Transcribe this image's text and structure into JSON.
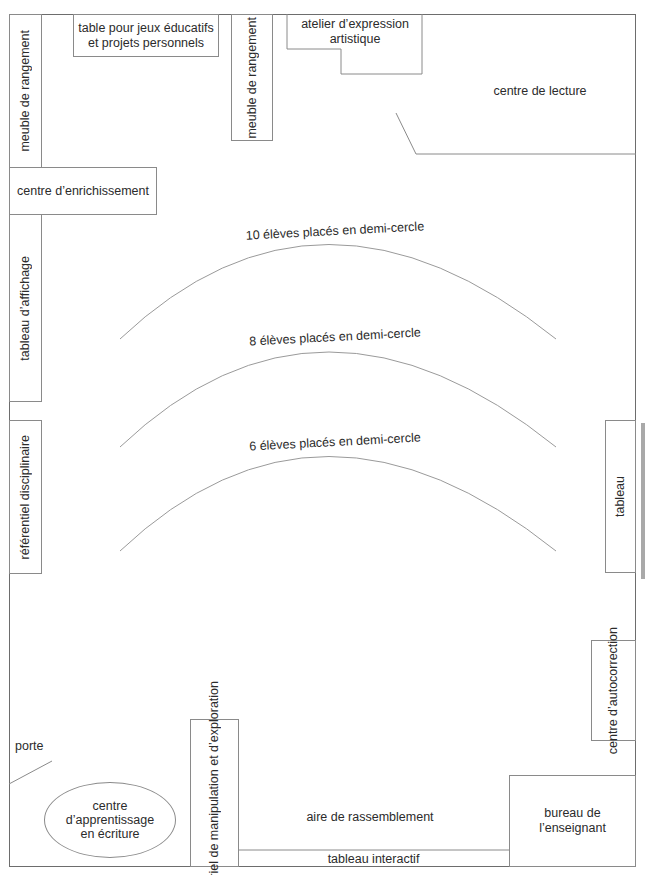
{
  "diagram": {
    "type": "classroom-floor-plan",
    "colors": {
      "line": "#8a8a8a",
      "outer_wall": "#6d6d6d",
      "text": "#2b2b2b",
      "side_bar": "#a9a9a9"
    },
    "zones": {
      "meuble_rangement_gauche": "meuble de rangement",
      "table_jeux": "table pour jeux éducatifs\net projets personnels",
      "meuble_rangement_centre": "meuble de rangement",
      "atelier_expression": "atelier d’expression\nartistique",
      "centre_lecture": "centre de lecture",
      "centre_enrichissement": "centre d’enrichissement",
      "tableau_affichage": "tableau d’affichage",
      "referentiel": "référentiel disciplinaire",
      "tableau": "tableau",
      "centre_autocorrection": "centre\nd’autocorrection",
      "porte": "porte",
      "centre_ecriture": "centre\nd’apprentissage\nen écriture",
      "materiel_manipulation": "matériel de manipulation\net d’exploration",
      "aire_rassemblement": "aire de rassemblement",
      "tableau_interactif": "tableau interactif",
      "bureau_enseignant": "bureau de\nl’enseignant"
    },
    "arcs": [
      {
        "label": "10 élèves placés en demi-cercle"
      },
      {
        "label": "8 élèves placés en demi-cercle"
      },
      {
        "label": "6 élèves placés en demi-cercle"
      }
    ]
  }
}
